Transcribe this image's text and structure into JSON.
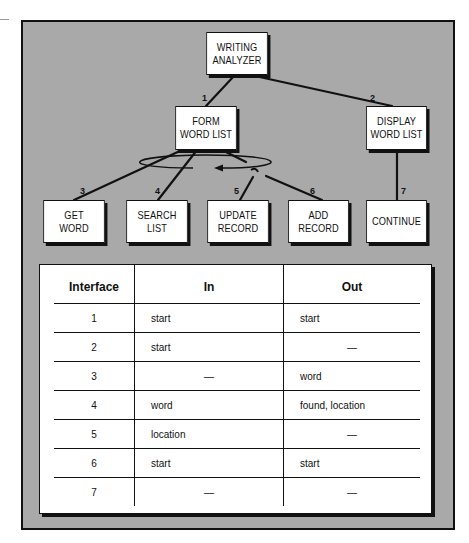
{
  "diagram": {
    "nodes": {
      "root": "WRITING\nANALYZER",
      "form": "FORM\nWORD LIST",
      "display": "DISPLAY\nWORD LIST",
      "get": "GET\nWORD",
      "search": "SEARCH\nLIST",
      "update": "UPDATE\nRECORD",
      "add": "ADD\nRECORD",
      "continue": "CONTINUE"
    },
    "interface_labels": [
      "1",
      "2",
      "3",
      "4",
      "5",
      "6",
      "7"
    ],
    "loop_symbol": "iteration-loop-arrow",
    "selection_symbol": "selection-hook"
  },
  "table": {
    "headers": [
      "Interface",
      "In",
      "Out"
    ],
    "rows": [
      {
        "id": "1",
        "in": "start",
        "out": "start"
      },
      {
        "id": "2",
        "in": "start",
        "out": "—"
      },
      {
        "id": "3",
        "in": "—",
        "out": "word"
      },
      {
        "id": "4",
        "in": "word",
        "out": "found, location"
      },
      {
        "id": "5",
        "in": "location",
        "out": "—"
      },
      {
        "id": "6",
        "in": "start",
        "out": "start"
      },
      {
        "id": "7",
        "in": "—",
        "out": "—"
      }
    ]
  },
  "colors": {
    "background_panel": "#a9a9a9",
    "lines": "#111111",
    "box_fill": "#ffffff"
  }
}
